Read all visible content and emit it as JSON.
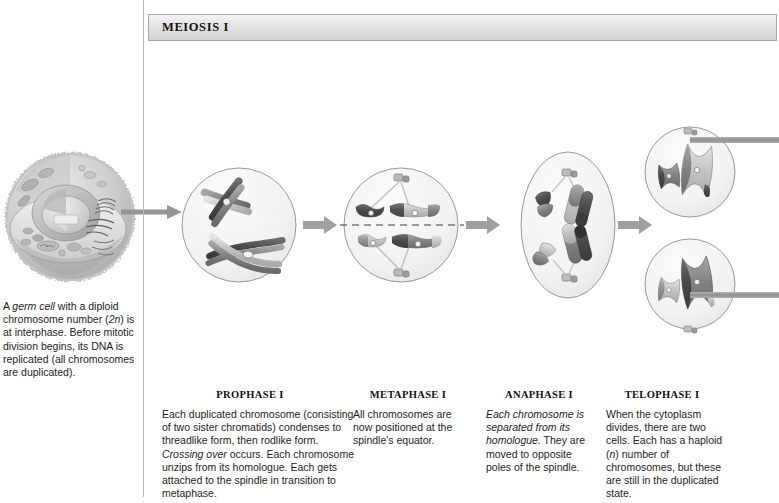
{
  "figure": {
    "panel_title": "MEIOSIS I",
    "accent_gray": "#8c8c8c",
    "line_gray": "#b9b9b9",
    "chromosome_dark": "#4a4a4a",
    "chromosome_mid": "#7d7d7d",
    "chromosome_light": "#c9c9c9"
  },
  "germ_cell": {
    "caption_a": "A ",
    "caption_italic_1": "germ cell",
    "caption_b": " with a diploid chromosome number (",
    "caption_italic_2": "2n",
    "caption_c": ") is at interphase. Before mitotic division begins, its DNA is replicated (all chromosomes are duplicated).",
    "art_name": "germ-cell-interphase-illustration"
  },
  "stages": [
    {
      "id": "prophase",
      "head": "PROPHASE I",
      "body_plain_1": "Each duplicated chromosome (consisting of two sister chromatids) condenses to threadlike form, then rodlike form. ",
      "body_italic": "Crossing over",
      "body_plain_2": " occurs. Each chromosome unzips from its homologue. Each gets attached to the spindle in transition to metaphase."
    },
    {
      "id": "metaphase",
      "head": "METAPHASE I",
      "body_plain_1": "All chromosomes are now positioned at the spindle's equator.",
      "body_italic": "",
      "body_plain_2": ""
    },
    {
      "id": "anaphase",
      "head": "ANAPHASE I",
      "body_plain_1": "",
      "body_italic": "Each chromosome is separated from its homologue.",
      "body_plain_2": " They are moved to opposite poles of the spindle."
    },
    {
      "id": "telophase",
      "head": "TELOPHASE I",
      "body_plain_1": "When the cytoplasm divides, there are two cells. Each has a haploid (",
      "body_italic": "n",
      "body_plain_2": ") number of chromosomes, but these are still in the duplicated state."
    }
  ],
  "icons": {
    "entry_arrow": "right-arrow-icon",
    "stage_arrow": "right-arrow-icon",
    "exit_connector": "horizontal-connector-bar",
    "equator": "dashed-equator-line",
    "centriole": "centriole-icon",
    "spindle_fiber": "spindle-fiber-line"
  }
}
